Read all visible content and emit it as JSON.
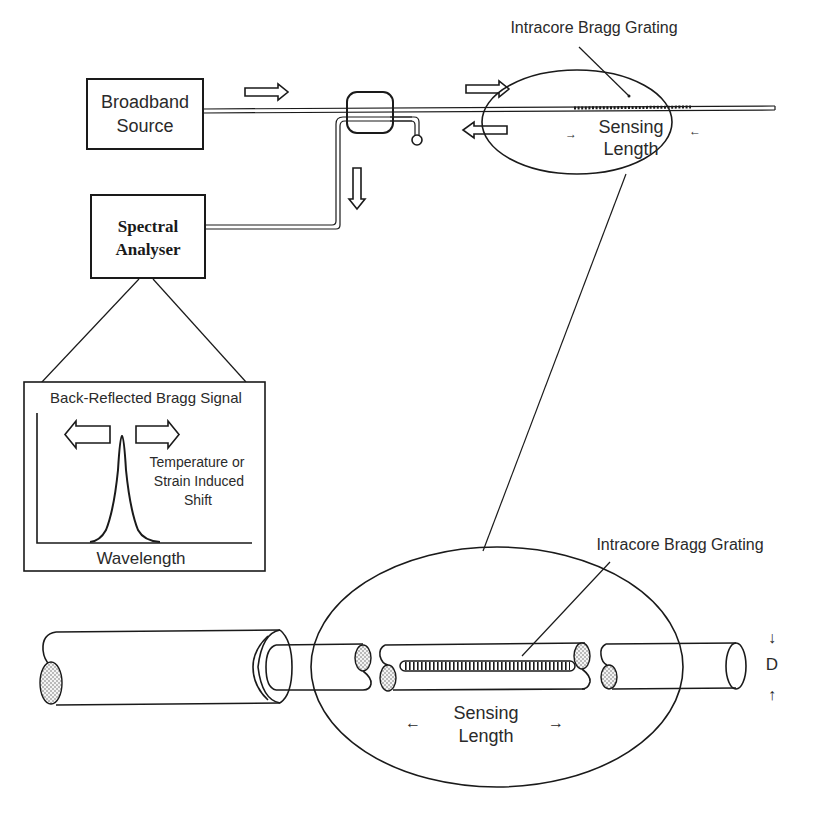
{
  "diagram": {
    "type": "fiber-bragg-grating-sensor-system",
    "components": {
      "source": {
        "label_line1": "Broadband",
        "label_line2": "Source"
      },
      "analyser": {
        "label_line1": "Spectral",
        "label_line2": "Analyser"
      },
      "coupler": {
        "label": ""
      },
      "top_grating": {
        "label": "Intracore Bragg Grating",
        "sensing_line1": "Sensing",
        "sensing_line2": "Length",
        "left_arrow": "→",
        "right_arrow": "←"
      },
      "spectrum_inset": {
        "title": "Back-Reflected Bragg Signal",
        "shift_line1": "Temperature or",
        "shift_line2": "Strain Induced",
        "shift_line3": "Shift",
        "xlabel": "Wavelength"
      },
      "magnified_fiber": {
        "grating_label": "Intracore Bragg Grating",
        "sensing_line1": "Sensing",
        "sensing_line2": "Length",
        "left_arrow": "←",
        "right_arrow": "→",
        "diameter_label": "D",
        "diameter_arrow_top": "↓",
        "diameter_arrow_bottom": "↑"
      }
    },
    "flow_arrows": [
      {
        "id": "source-to-coupler",
        "direction": "right"
      },
      {
        "id": "coupler-to-grating",
        "direction": "right"
      },
      {
        "id": "grating-reflection",
        "direction": "left"
      },
      {
        "id": "coupler-to-analyser",
        "direction": "down"
      }
    ],
    "colors": {
      "ink": "#1a1a1a",
      "background": "#ffffff"
    }
  }
}
